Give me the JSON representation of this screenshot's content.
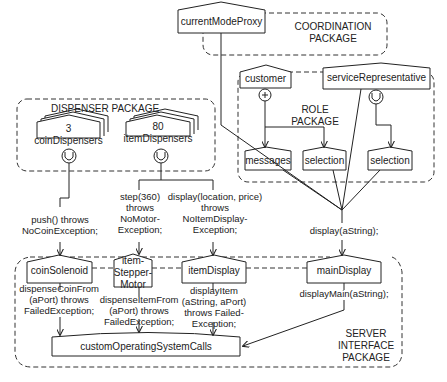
{
  "packages": {
    "coordination": "COORDINATION\nPACKAGE",
    "role": "ROLE\nPACKAGE",
    "dispenser": "DISPENSER PACKAGE",
    "server_interface": "SERVER\nINTERFACE\nPACKAGE"
  },
  "objects": {
    "current_mode_proxy": "currentModeProxy",
    "customer": "customer",
    "service_representative": "serviceRepresentative",
    "messages": "messages",
    "selection_1": "selection",
    "selection_2": "selection",
    "coin_dispensers": "3\ncoinDispensers",
    "item_dispensers": "80\nitemDispensers",
    "coin_solenoid": "coinSolenoid",
    "item_stepper_motor": "item-\nStepper-\nMotor",
    "item_display": "itemDisplay",
    "main_display": "mainDisplay",
    "custom_os_calls": "customOperatingSystemCalls"
  },
  "messages": {
    "push": "push() throws\nNoCoinException;",
    "step": "step(360)\nthrows\nNoMotor-\nException;",
    "display_location": "display(location, price)\nthrows\nNoItemDisplay-\nException;",
    "display_astring": "display(aString);",
    "dispense_coin": "dispenseCoinFrom\n(aPort) throws\nFailedException;",
    "dispense_item": "dispenseItemFrom\n(aPort) throws\nFailedException;",
    "display_item": "displayItem\n(aString, aPort)\nthrows Failed-\nException;",
    "display_main": "displayMain(aString);"
  },
  "symbols": {
    "plus": "+"
  }
}
